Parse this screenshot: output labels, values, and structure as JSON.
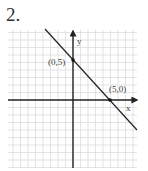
{
  "problem": {
    "number_label": "2."
  },
  "chart_data": {
    "type": "line",
    "title": "",
    "xlabel": "x",
    "ylabel": "y",
    "equation": "y = -x + 5",
    "xlim": [
      -8.5,
      8.5
    ],
    "ylim": [
      -9,
      9.5
    ],
    "grid": true,
    "series": [
      {
        "name": "line",
        "x": [
          -3.7,
          8.5
        ],
        "y": [
          8.7,
          -3.5
        ]
      }
    ],
    "points": [
      {
        "x": 0,
        "y": 5,
        "label": "(0,5)"
      },
      {
        "x": 5,
        "y": 0,
        "label": "(5,0)"
      }
    ],
    "annotations": [
      "(0,5)",
      "(5,0)"
    ]
  },
  "colors": {
    "grid": "#d8d8d8",
    "axes": "#222222",
    "line": "#222222"
  }
}
